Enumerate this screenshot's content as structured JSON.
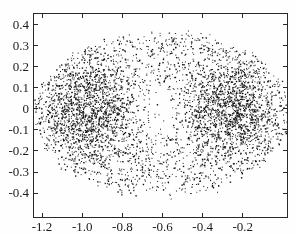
{
  "figure": {
    "background": "#fefefe",
    "axis_color": "#2a2a2a",
    "label_color": "#1b1b1b"
  },
  "chart_data": {
    "type": "scatter",
    "title": "",
    "xlabel": "",
    "ylabel": "",
    "legend": "none",
    "grid": "off",
    "box": "on",
    "xlim": [
      -1.245,
      0.025
    ],
    "ylim": [
      -0.519,
      0.457
    ],
    "xticks": {
      "values": [
        -1.2,
        -1.0,
        -0.8,
        -0.6,
        -0.4,
        -0.2
      ],
      "labels": [
        "-1.2",
        "-1.0",
        "-0.8",
        "-0.6",
        "-0.4",
        "-0.2"
      ]
    },
    "yticks": {
      "values": [
        0.4,
        0.3,
        0.2,
        0.1,
        0,
        -0.1,
        -0.2,
        -0.3,
        -0.4
      ],
      "labels": [
        "0.4",
        "0.3",
        "0.2",
        "0.1",
        "0",
        "-0.1",
        "-0.2",
        "-0.3",
        "-0.4"
      ]
    },
    "point_colors": [
      "#101010",
      "#353535"
    ],
    "point_size_px": [
      1,
      1.4
    ],
    "distribution": {
      "description": "chaotic-sea point cloud: wide oval region, dense lobes around two stable fixed points, sparse center",
      "seed": 42,
      "ellipse": {
        "cx": -0.605,
        "cy": -0.02,
        "rx": 0.625,
        "ry": 0.39
      },
      "clusters": [
        {
          "cx": -0.975,
          "cy": -0.005,
          "sx": 0.135,
          "sy": 0.125,
          "n": 1400
        },
        {
          "cx": -0.265,
          "cy": -0.005,
          "sx": 0.135,
          "sy": 0.125,
          "n": 1400
        }
      ],
      "sea": {
        "n": 1750,
        "r_min": 0.06,
        "r_pow": 0.45,
        "edge_jitter": 0.022
      }
    },
    "fixed_points": [
      {
        "x": -0.975,
        "y": -0.005
      },
      {
        "x": -0.265,
        "y": -0.005
      }
    ],
    "fixed_point_radius_px": 3.5
  }
}
